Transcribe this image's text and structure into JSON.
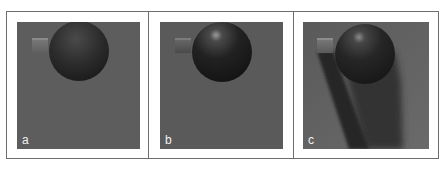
{
  "figure": {
    "background": "#ffffff",
    "border_color": "#6e6e6e",
    "render_background": "#5d5d5d",
    "panels": [
      {
        "label": "a",
        "description": "Sphere and cube rendered with diffuse shading only",
        "sphere_shading": "diffuse",
        "specular_highlight": false,
        "cast_shadow": false
      },
      {
        "label": "b",
        "description": "Sphere and cube rendered with diffuse and specular shading",
        "sphere_shading": "diffuse+specular",
        "specular_highlight": true,
        "cast_shadow": false
      },
      {
        "label": "c",
        "description": "Sphere and cube rendered with specular shading and cast shadows",
        "sphere_shading": "diffuse+specular",
        "specular_highlight": true,
        "cast_shadow": true
      }
    ]
  }
}
